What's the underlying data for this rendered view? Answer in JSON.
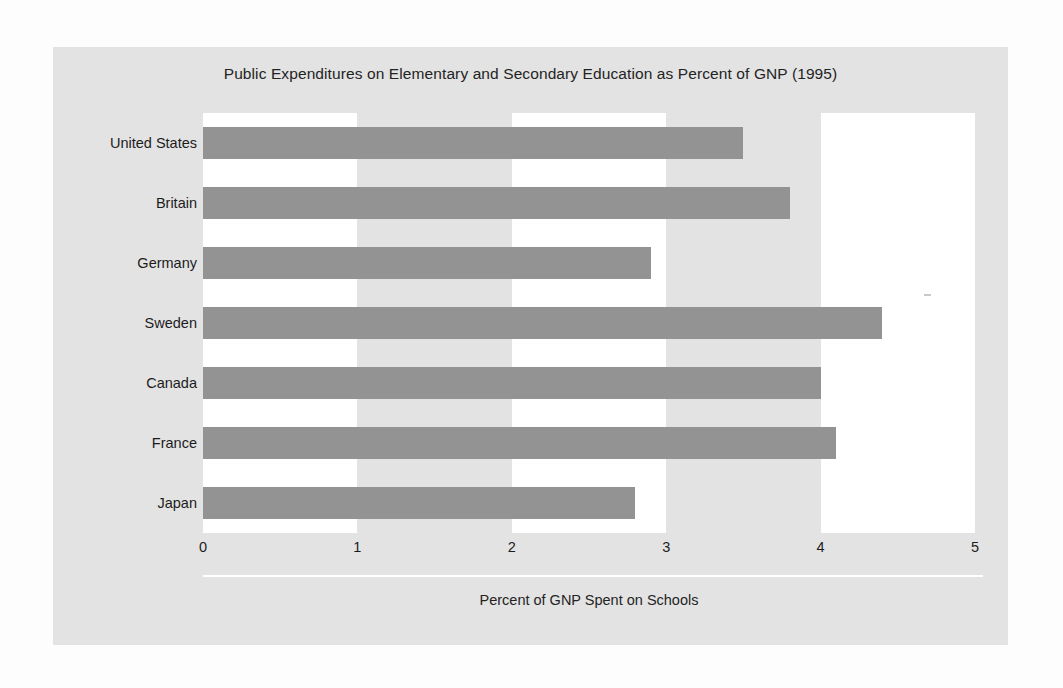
{
  "chart_data": {
    "type": "bar",
    "orientation": "horizontal",
    "title": "Public Expenditures on Elementary and Secondary Education as Percent of GNP (1995)",
    "xlabel": "Percent of GNP Spent on Schools",
    "ylabel": "",
    "categories": [
      "United States",
      "Britain",
      "Germany",
      "Sweden",
      "Canada",
      "France",
      "Japan"
    ],
    "values": [
      3.5,
      3.8,
      2.9,
      4.4,
      4.0,
      4.1,
      2.8
    ],
    "xlim": [
      0,
      5
    ],
    "xticks": [
      "0",
      "1",
      "2",
      "3",
      "4",
      "5"
    ],
    "xtick_values": [
      0,
      1,
      2,
      3,
      4,
      5
    ],
    "grid": "alternating vertical bands",
    "legend": "none",
    "bar_color": "#939393",
    "band_color": "#ffffff",
    "panel_color": "#e3e3e3"
  },
  "colors": {
    "bar": "#939393",
    "panel": "#e3e3e3",
    "band": "#ffffff",
    "page": "#fdfdfd",
    "text": "#1c1c1c",
    "rule": "#ffffff"
  }
}
